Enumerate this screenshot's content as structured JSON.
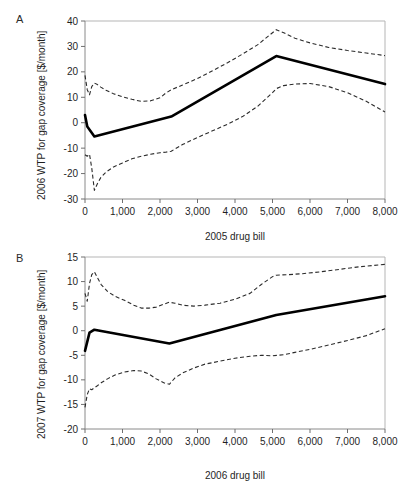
{
  "figure": {
    "panels": [
      {
        "letter": "A",
        "ylabel": "2006 WTP for gap coverage [$/month]",
        "xlabel": "2005 drug bill"
      },
      {
        "letter": "B",
        "ylabel": "2007 WTP for gap coverage [$/month]",
        "xlabel": "2006 drug bill"
      }
    ]
  },
  "chart_data": [
    {
      "type": "line",
      "panel": "A",
      "title": "",
      "xlabel": "2005 drug bill",
      "ylabel": "2006 WTP for gap coverage [$/month]",
      "xlim": [
        0,
        8000
      ],
      "ylim": [
        -30,
        40
      ],
      "xticks": [
        0,
        1000,
        2000,
        3000,
        4000,
        5000,
        6000,
        7000,
        8000
      ],
      "xticklabels": [
        "0",
        "1,000",
        "2,000",
        "3,000",
        "4,000",
        "5,000",
        "6,000",
        "7,000",
        "8,000"
      ],
      "yticks": [
        -30,
        -20,
        -10,
        0,
        10,
        20,
        30,
        40
      ],
      "yticklabels": [
        "-30",
        "-20",
        "-10",
        "0",
        "10",
        "20",
        "30",
        "40"
      ],
      "grid": false,
      "legend": false,
      "series": [
        {
          "name": "mean WTP",
          "style": "solid-thick",
          "x": [
            0,
            60,
            250,
            2300,
            5100,
            8000
          ],
          "values": [
            3.0,
            -1.5,
            -5.4,
            2.4,
            26.2,
            15.2
          ]
        },
        {
          "name": "upper 95% confidence limit",
          "style": "dashed",
          "x": [
            0,
            60,
            120,
            180,
            250,
            330,
            420,
            560,
            760,
            1000,
            1250,
            1500,
            1750,
            2000,
            2150,
            2300,
            2600,
            3000,
            3400,
            3800,
            4200,
            4600,
            5000,
            5100,
            5300,
            5600,
            6000,
            6500,
            7000,
            7500,
            8000
          ],
          "values": [
            18.6,
            13.0,
            11.0,
            14.2,
            15.6,
            15.0,
            14.0,
            12.8,
            11.4,
            10.2,
            9.2,
            8.4,
            8.6,
            9.8,
            11.6,
            13.0,
            14.8,
            17.4,
            20.4,
            23.6,
            27.0,
            30.6,
            35.4,
            36.6,
            35.4,
            33.2,
            31.4,
            29.6,
            28.4,
            27.4,
            26.4
          ]
        },
        {
          "name": "lower 95% confidence limit",
          "style": "dashed",
          "x": [
            0,
            60,
            120,
            180,
            250,
            330,
            420,
            560,
            760,
            1000,
            1250,
            1500,
            1750,
            2000,
            2150,
            2300,
            2600,
            3000,
            3400,
            3800,
            4200,
            4600,
            5000,
            5100,
            5300,
            5600,
            6000,
            6500,
            7000,
            7500,
            8000
          ],
          "values": [
            -12.6,
            -13.2,
            -12.4,
            -17.8,
            -26.6,
            -24.0,
            -21.6,
            -19.4,
            -17.4,
            -15.8,
            -14.2,
            -13.2,
            -12.4,
            -11.8,
            -11.6,
            -11.2,
            -8.6,
            -5.8,
            -3.2,
            -0.6,
            2.4,
            6.4,
            11.8,
            13.4,
            14.6,
            15.2,
            15.4,
            14.2,
            11.8,
            8.4,
            4.2
          ]
        }
      ]
    },
    {
      "type": "line",
      "panel": "B",
      "title": "",
      "xlabel": "2006 drug bill",
      "ylabel": "2007 WTP for gap coverage [$/month]",
      "xlim": [
        0,
        8000
      ],
      "ylim": [
        -20,
        15
      ],
      "xticks": [
        0,
        1000,
        2000,
        3000,
        4000,
        5000,
        6000,
        7000,
        8000
      ],
      "xticklabels": [
        "0",
        "1,000",
        "2,000",
        "3,000",
        "4,000",
        "5,000",
        "6,000",
        "7,000",
        "8,000"
      ],
      "yticks": [
        -20,
        -15,
        -10,
        -5,
        0,
        5,
        10,
        15
      ],
      "yticklabels": [
        "-20",
        "-15",
        "-10",
        "-5",
        "0",
        "5",
        "10",
        "15"
      ],
      "grid": false,
      "legend": false,
      "series": [
        {
          "name": "mean WTP",
          "style": "solid-thick",
          "x": [
            0,
            120,
            250,
            2250,
            5100,
            8000
          ],
          "values": [
            -4.1,
            -0.4,
            0.2,
            -2.6,
            3.2,
            7.0
          ]
        },
        {
          "name": "upper 95% confidence limit",
          "style": "dashed",
          "x": [
            0,
            60,
            120,
            180,
            250,
            330,
            430,
            600,
            800,
            1050,
            1300,
            1500,
            1700,
            1900,
            2100,
            2250,
            2400,
            2600,
            2900,
            3200,
            3600,
            4000,
            4400,
            4700,
            5000,
            5100,
            5400,
            5800,
            6300,
            6800,
            7300,
            8000
          ],
          "values": [
            7.6,
            6.0,
            9.6,
            11.4,
            12.0,
            10.8,
            9.4,
            8.0,
            7.0,
            6.2,
            5.2,
            4.6,
            4.6,
            4.8,
            5.4,
            5.8,
            5.6,
            5.2,
            5.0,
            5.2,
            5.6,
            6.4,
            7.6,
            9.4,
            11.0,
            11.3,
            11.4,
            11.6,
            12.0,
            12.5,
            13.0,
            13.5
          ]
        },
        {
          "name": "lower 95% confidence limit",
          "style": "dashed",
          "x": [
            0,
            60,
            120,
            180,
            250,
            330,
            430,
            600,
            800,
            1050,
            1300,
            1500,
            1700,
            1900,
            2100,
            2250,
            2400,
            2600,
            2900,
            3200,
            3600,
            4000,
            4400,
            4700,
            5000,
            5300,
            5600,
            6000,
            6500,
            7000,
            7500,
            8000
          ],
          "values": [
            -15.6,
            -13.0,
            -11.8,
            -12.0,
            -11.6,
            -11.2,
            -10.6,
            -9.8,
            -9.0,
            -8.4,
            -8.1,
            -8.2,
            -8.8,
            -9.8,
            -10.6,
            -10.9,
            -9.6,
            -8.6,
            -7.6,
            -6.8,
            -6.2,
            -5.6,
            -5.2,
            -5.0,
            -5.1,
            -4.9,
            -4.4,
            -3.8,
            -2.9,
            -2.0,
            -1.0,
            0.4
          ]
        }
      ]
    }
  ]
}
